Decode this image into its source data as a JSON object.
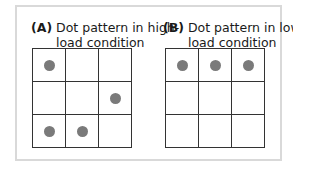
{
  "panels": [
    {
      "label": "(A)",
      "title_line1": "Dot pattern in high-",
      "title_line2": "load condition",
      "dots": [
        1,
        0,
        0,
        0,
        0,
        1,
        1,
        1,
        0
      ]
    },
    {
      "label": "(B)",
      "title_line1": "Dot pattern in low-",
      "title_line2": "load condition",
      "dots": [
        1,
        1,
        1,
        0,
        0,
        0,
        0,
        0,
        0
      ]
    }
  ],
  "colors": {
    "dot": "#7a7a7a",
    "grid_line": "#333333",
    "frame": "#d9d9d9"
  }
}
